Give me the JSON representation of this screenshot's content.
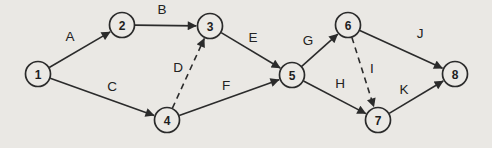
{
  "diagram": {
    "type": "activity-network",
    "background": "#eae8e4",
    "line_color": "#2b2b2b",
    "node_fill": "#ebe9e5",
    "node_radius": 12.5,
    "nodes": [
      {
        "id": "1",
        "x": 38,
        "y": 74
      },
      {
        "id": "2",
        "x": 122,
        "y": 25
      },
      {
        "id": "3",
        "x": 210,
        "y": 26
      },
      {
        "id": "4",
        "x": 167,
        "y": 120
      },
      {
        "id": "5",
        "x": 292,
        "y": 75
      },
      {
        "id": "6",
        "x": 348,
        "y": 25
      },
      {
        "id": "7",
        "x": 378,
        "y": 120
      },
      {
        "id": "8",
        "x": 455,
        "y": 74
      }
    ],
    "edges": [
      {
        "label": "A",
        "from": "1",
        "to": "2",
        "dashed": false,
        "lx": 70,
        "ly": 36
      },
      {
        "label": "B",
        "from": "2",
        "to": "3",
        "dashed": false,
        "lx": 162,
        "ly": 9
      },
      {
        "label": "C",
        "from": "1",
        "to": "4",
        "dashed": false,
        "lx": 112,
        "ly": 86
      },
      {
        "label": "D",
        "from": "4",
        "to": "3",
        "dashed": true,
        "lx": 178,
        "ly": 67
      },
      {
        "label": "E",
        "from": "3",
        "to": "5",
        "dashed": false,
        "lx": 253,
        "ly": 37
      },
      {
        "label": "F",
        "from": "4",
        "to": "5",
        "dashed": false,
        "lx": 226,
        "ly": 85
      },
      {
        "label": "G",
        "from": "5",
        "to": "6",
        "dashed": false,
        "lx": 308,
        "ly": 40
      },
      {
        "label": "H",
        "from": "5",
        "to": "7",
        "dashed": false,
        "lx": 340,
        "ly": 83
      },
      {
        "label": "I",
        "from": "6",
        "to": "7",
        "dashed": true,
        "lx": 372,
        "ly": 68
      },
      {
        "label": "J",
        "from": "6",
        "to": "8",
        "dashed": false,
        "lx": 420,
        "ly": 33
      },
      {
        "label": "K",
        "from": "7",
        "to": "8",
        "dashed": false,
        "lx": 404,
        "ly": 89
      }
    ]
  }
}
